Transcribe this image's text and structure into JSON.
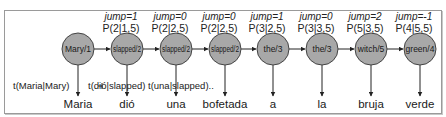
{
  "diagram": {
    "type": "hmm-alignment",
    "node_fill": "#a8a8a8",
    "node_stroke": "#444444",
    "edge_color": "#222222",
    "nodes": [
      {
        "label": "Mary/1",
        "x": 78
      },
      {
        "label": "slapped/2",
        "x": 127,
        "jump": "jump=1",
        "prob": "P(2|1,5)"
      },
      {
        "label": "slapped/2",
        "x": 176,
        "jump": "jump=0",
        "prob": "P(2|2,5)"
      },
      {
        "label": "slapped/2",
        "x": 225,
        "jump": "jump=0",
        "prob": "P(2|2,5)"
      },
      {
        "label": "the/3",
        "x": 273,
        "jump": "jump=1",
        "prob": "P(3|2,5)"
      },
      {
        "label": "the/3",
        "x": 322,
        "jump": "jump=0",
        "prob": "P(3|3,5)"
      },
      {
        "label": "witch/5",
        "x": 371,
        "jump": "jump=2",
        "prob": "P(5|3,5)"
      },
      {
        "label": "green/4",
        "x": 420,
        "jump": "jump=-1",
        "prob": "P(4|5,5)"
      }
    ],
    "translation_labels": [
      {
        "text": "t(Maria|Mary)",
        "x": 13
      },
      {
        "text": "t(dió|slapped)",
        "x": 88
      },
      {
        "text": "t(una|slapped)..",
        "x": 148
      }
    ],
    "spanish_words": [
      "Maria",
      "dió",
      "una",
      "bofetada",
      "a",
      "la",
      "bruja",
      "verde"
    ]
  }
}
